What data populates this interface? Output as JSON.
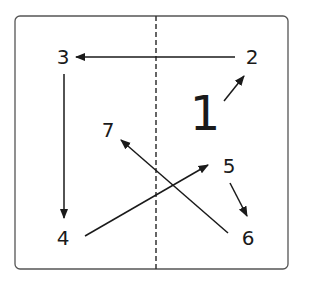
{
  "diagram": {
    "title_number": "1",
    "nodes": [
      {
        "id": "2",
        "label": "2",
        "x": 252,
        "y": 57
      },
      {
        "id": "3",
        "label": "3",
        "x": 64,
        "y": 57
      },
      {
        "id": "4",
        "label": "4",
        "x": 64,
        "y": 238
      },
      {
        "id": "5",
        "label": "5",
        "x": 230,
        "y": 166
      },
      {
        "id": "6",
        "label": "6",
        "x": 248,
        "y": 238
      },
      {
        "id": "7",
        "label": "7",
        "x": 108,
        "y": 130
      }
    ],
    "edges": [
      {
        "from": "2",
        "to": "3"
      },
      {
        "from": "3",
        "to": "4"
      },
      {
        "from": "4",
        "to": "5"
      },
      {
        "from": "5",
        "to": "6"
      },
      {
        "from": "6",
        "to": "7"
      },
      {
        "from": "1",
        "to": "2"
      }
    ],
    "colors": {
      "stroke": "#1a1a1a",
      "frame": "#555555"
    }
  }
}
